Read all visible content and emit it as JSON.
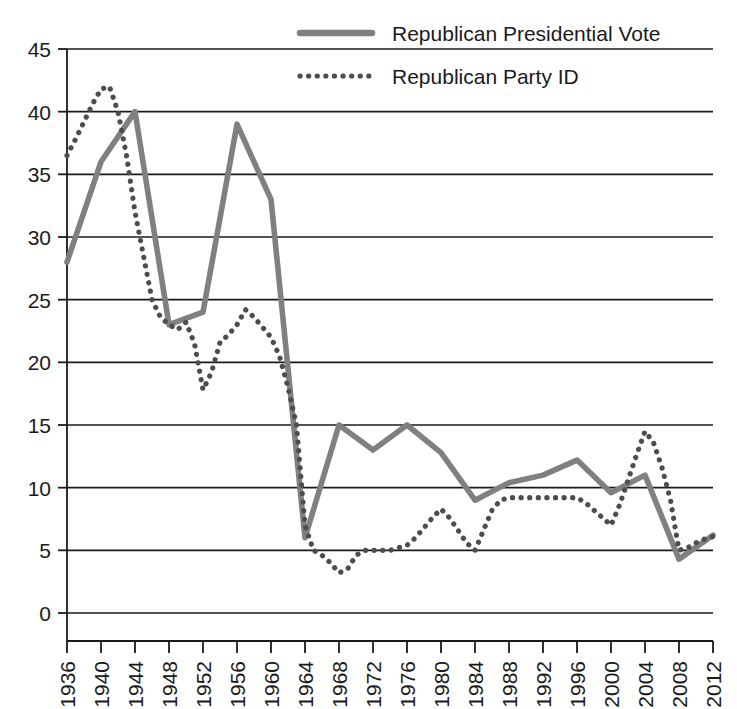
{
  "chart_data": {
    "type": "line",
    "title": "",
    "xlabel": "",
    "ylabel": "",
    "ylim": [
      0,
      45
    ],
    "ytick_step": 5,
    "grid": "horizontal",
    "legend_position": "top-right",
    "yticks": [
      "45",
      "40",
      "35",
      "30",
      "25",
      "20",
      "15",
      "10",
      "5",
      "0"
    ],
    "categories": [
      "1936",
      "1940",
      "1944",
      "1948",
      "1952",
      "1956",
      "1960",
      "1964",
      "1968",
      "1972",
      "1976",
      "1980",
      "1984",
      "1988",
      "1992",
      "1996",
      "2000",
      "2004",
      "2008",
      "2012"
    ],
    "xlim": [
      1936,
      2012
    ],
    "series": [
      {
        "name": "Republican Presidential Vote",
        "style": "solid",
        "color": "#808080",
        "x": [
          1936,
          1940,
          1944,
          1948,
          1952,
          1956,
          1960,
          1964,
          1968,
          1972,
          1976,
          1980,
          1984,
          1988,
          1992,
          1996,
          2000,
          2004,
          2008,
          2012
        ],
        "values": [
          28,
          36,
          40,
          23,
          24,
          39,
          33,
          6,
          15,
          13,
          15,
          12.8,
          9,
          10.4,
          11,
          12.2,
          9.6,
          11,
          4.3,
          6.2
        ]
      },
      {
        "name": "Republican Party ID",
        "style": "dotted",
        "color": "#4d4d4d",
        "x": [
          1936,
          1937,
          1938,
          1939,
          1940,
          1941,
          1942,
          1943,
          1944,
          1945,
          1946,
          1947,
          1948,
          1949,
          1950,
          1951,
          1952,
          1953,
          1954,
          1955,
          1956,
          1957,
          1958,
          1959,
          1960,
          1961,
          1962,
          1963,
          1964,
          1965,
          1966,
          1967,
          1968,
          1969,
          1970,
          1971,
          1972,
          1973,
          1974,
          1975,
          1976,
          1977,
          1978,
          1979,
          1980,
          1981,
          1982,
          1983,
          1984,
          1985,
          1986,
          1987,
          1988,
          1989,
          1990,
          1991,
          1992,
          1993,
          1994,
          1995,
          1996,
          1997,
          1998,
          1999,
          2000,
          2001,
          2002,
          2003,
          2004,
          2005,
          2006,
          2007,
          2008,
          2009,
          2010,
          2011,
          2012
        ],
        "values": [
          36.5,
          37.8,
          39.2,
          40.6,
          41.8,
          42.0,
          40.0,
          36.5,
          32.0,
          28.5,
          25.0,
          23.6,
          23.0,
          22.6,
          23.2,
          21.5,
          17.8,
          19.2,
          21.6,
          22.2,
          23.0,
          24.2,
          23.6,
          22.8,
          22.0,
          20.5,
          18.0,
          15.0,
          7.0,
          5.0,
          4.6,
          4.0,
          3.2,
          3.5,
          4.6,
          5.0,
          5.0,
          5.0,
          5.0,
          5.2,
          5.4,
          6.0,
          6.8,
          7.6,
          8.3,
          7.6,
          6.6,
          5.6,
          5.0,
          6.6,
          8.2,
          9.0,
          9.2,
          9.2,
          9.2,
          9.2,
          9.2,
          9.2,
          9.2,
          9.2,
          9.2,
          8.8,
          8.2,
          7.6,
          7.0,
          8.6,
          10.6,
          12.6,
          14.5,
          13.6,
          11.6,
          9.0,
          5.0,
          5.2,
          5.6,
          5.9,
          6.1
        ]
      }
    ]
  },
  "legend": {
    "items": [
      {
        "label": "Republican Presidential Vote",
        "swatch": "solid-line-swatch"
      },
      {
        "label": "Republican Party ID",
        "swatch": "dotted-line-swatch"
      }
    ]
  }
}
